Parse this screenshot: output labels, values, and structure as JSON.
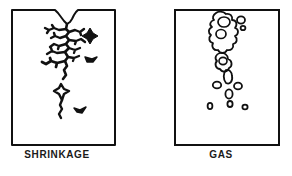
{
  "figure": {
    "background_color": "#ffffff",
    "line_color": "#111111",
    "panel_count": 2
  },
  "panels": [
    {
      "id": "shrinkage",
      "caption": "SHRINKAGE",
      "defect_type": "shrinkage",
      "box": {
        "x": 12,
        "y": 9,
        "width": 103,
        "height": 136
      },
      "top_edge": "notched",
      "void_style": "angular-jagged-dendritic",
      "description_visual": "Rectangular section with a V-shaped depression in the top edge and a branching, spiky vertical crack network descending from the notch, plus isolated angular voids to the right."
    },
    {
      "id": "gas",
      "caption": "GAS",
      "defect_type": "gas",
      "box": {
        "x": 29,
        "y": 9,
        "width": 104,
        "height": 136
      },
      "top_edge": "straight",
      "void_style": "rounded-blobby-porosity",
      "description_visual": "Rectangular section with a straight top edge and a vertical column of rounded, bubble-like pores descending from the top, thinning into small scattered round voids below."
    }
  ],
  "captions": {
    "shrinkage": "SHRINKAGE",
    "gas": "GAS"
  },
  "colors": {
    "outline": "#111111",
    "background": "#ffffff",
    "caption_text": "#1a1a1a"
  }
}
